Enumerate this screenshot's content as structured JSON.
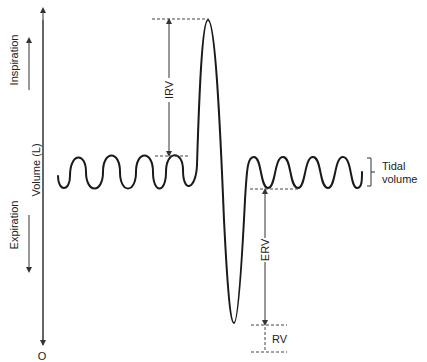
{
  "diagram": {
    "axis": {
      "y_label": "Volume (L)",
      "origin_label": "O",
      "up_direction_label": "Inspiration",
      "down_direction_label": "Expiration"
    },
    "annotations": {
      "irv": "IRV",
      "erv": "ERV",
      "rv": "RV",
      "tidal_line1": "Tidal",
      "tidal_line2": "volume"
    },
    "colors": {
      "curve": "#1a1a1a",
      "text": "#222222",
      "background": "#ffffff"
    }
  }
}
